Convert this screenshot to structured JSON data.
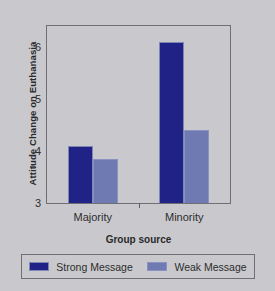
{
  "chart_data": {
    "type": "bar",
    "title": "",
    "xlabel": "Group source",
    "ylabel": "Attitude Change on Euthanasia",
    "categories": [
      "Majority",
      "Minority"
    ],
    "series": [
      {
        "name": "Strong Message",
        "values": [
          4.1,
          6.1
        ],
        "color": "#212285"
      },
      {
        "name": "Weak Message",
        "values": [
          3.85,
          4.4
        ],
        "color": "#6f79b2"
      }
    ],
    "ylim": [
      3,
      6.4
    ],
    "yticks": [
      3,
      4,
      5,
      6
    ],
    "ytick_labels": [
      "3",
      "4",
      "5",
      "6"
    ],
    "grid": false,
    "legend_position": "bottom",
    "background_color": "#c9c9cd",
    "frame_color": "#6e6e74"
  }
}
